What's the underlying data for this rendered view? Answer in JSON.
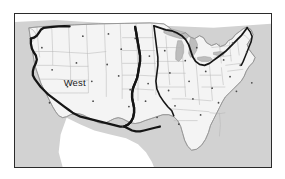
{
  "figure": {
    "type": "thematic-region-map",
    "frame": {
      "border_color": "#2b2b2b",
      "border_width_px": 1.5,
      "background_color": "#ffffff"
    }
  },
  "labels": [
    {
      "id": "west",
      "text": "West",
      "x_pct": 19.0,
      "y_pct": 41.0,
      "font_size_px": 9.5,
      "color": "#1a1a1a"
    }
  ],
  "colors": {
    "land_fill": "#f4f4f4",
    "land_outline": "#9a9a9a",
    "state_border": "#b4b4b4",
    "national_outline": "#808080",
    "ocean_fill": "#d2d2d2",
    "lake_fill": "#bdbdbd",
    "lake_outline": "#9a9a9a",
    "region_boundary": "#151515",
    "city_dot": "#4a4a4a",
    "neighbor_land_fill": "#ffffff",
    "frame_border": "#2b2b2b"
  },
  "legend_items": [
    {
      "name": "region-boundary-line",
      "description": "Heavy black line delineating the West region",
      "color": "#151515",
      "stroke_width_px": 2.2
    },
    {
      "name": "state-boundary-line",
      "description": "Thin gray lines dividing states",
      "color": "#b4b4b4",
      "stroke_width_px": 0.5
    },
    {
      "name": "city-point-marker",
      "description": "Small dark dots marking cities",
      "color": "#4a4a4a"
    }
  ],
  "water_bodies": [
    {
      "name": "pacific-ocean",
      "fill": "#d2d2d2"
    },
    {
      "name": "atlantic-ocean",
      "fill": "#d2d2d2"
    },
    {
      "name": "gulf-of-mexico",
      "fill": "#d2d2d2"
    },
    {
      "name": "great-lakes",
      "fill": "#bdbdbd"
    }
  ],
  "city_dots": [
    {
      "x_pct": 26.5,
      "y_pct": 14.5
    },
    {
      "x_pct": 10.5,
      "y_pct": 22.0
    },
    {
      "x_pct": 14.5,
      "y_pct": 36.5
    },
    {
      "x_pct": 24.0,
      "y_pct": 32.0
    },
    {
      "x_pct": 30.0,
      "y_pct": 44.0
    },
    {
      "x_pct": 20.5,
      "y_pct": 47.5
    },
    {
      "x_pct": 36.0,
      "y_pct": 33.0
    },
    {
      "x_pct": 30.5,
      "y_pct": 57.0
    },
    {
      "x_pct": 13.5,
      "y_pct": 58.0
    },
    {
      "x_pct": 41.5,
      "y_pct": 23.0
    },
    {
      "x_pct": 40.5,
      "y_pct": 40.5
    },
    {
      "x_pct": 45.0,
      "y_pct": 49.5
    },
    {
      "x_pct": 44.5,
      "y_pct": 60.5
    },
    {
      "x_pct": 42.0,
      "y_pct": 74.0
    },
    {
      "x_pct": 52.5,
      "y_pct": 27.5
    },
    {
      "x_pct": 52.0,
      "y_pct": 45.5
    },
    {
      "x_pct": 51.0,
      "y_pct": 57.0
    },
    {
      "x_pct": 55.5,
      "y_pct": 67.5
    },
    {
      "x_pct": 58.5,
      "y_pct": 24.0
    },
    {
      "x_pct": 60.5,
      "y_pct": 38.5
    },
    {
      "x_pct": 60.0,
      "y_pct": 50.0
    },
    {
      "x_pct": 62.5,
      "y_pct": 60.0
    },
    {
      "x_pct": 64.0,
      "y_pct": 72.0
    },
    {
      "x_pct": 66.5,
      "y_pct": 30.5
    },
    {
      "x_pct": 68.0,
      "y_pct": 44.0
    },
    {
      "x_pct": 69.5,
      "y_pct": 55.5
    },
    {
      "x_pct": 72.5,
      "y_pct": 66.0
    },
    {
      "x_pct": 74.5,
      "y_pct": 37.5
    },
    {
      "x_pct": 77.0,
      "y_pct": 48.5
    },
    {
      "x_pct": 79.5,
      "y_pct": 58.0
    },
    {
      "x_pct": 81.5,
      "y_pct": 30.0
    },
    {
      "x_pct": 84.0,
      "y_pct": 41.0
    },
    {
      "x_pct": 86.5,
      "y_pct": 50.5
    },
    {
      "x_pct": 88.0,
      "y_pct": 33.5
    },
    {
      "x_pct": 90.5,
      "y_pct": 25.0
    },
    {
      "x_pct": 92.5,
      "y_pct": 45.0
    },
    {
      "x_pct": 85.0,
      "y_pct": 19.0
    },
    {
      "x_pct": 71.0,
      "y_pct": 22.0
    },
    {
      "x_pct": 47.0,
      "y_pct": 16.0
    },
    {
      "x_pct": 36.5,
      "y_pct": 13.0
    }
  ]
}
